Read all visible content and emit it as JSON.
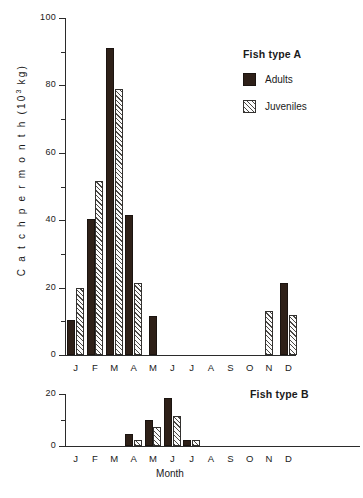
{
  "chart_data": [
    {
      "type": "bar",
      "panel": "A",
      "title": "Fish type  A",
      "xlabel": "",
      "ylabel": "Catch per month (10³ kg)",
      "ylabel_prefix": "C a t c h   p e r   m o n t h   (10",
      "ylabel_exp": "3",
      "ylabel_suffix": " kg)",
      "categories": [
        "J",
        "F",
        "M",
        "A",
        "M",
        "J",
        "J",
        "A",
        "S",
        "O",
        "N",
        "D"
      ],
      "ylim": [
        0,
        100
      ],
      "yticks_major": [
        0,
        20,
        40,
        60,
        80,
        100
      ],
      "yticks_minor": [
        10,
        30,
        50,
        70,
        90
      ],
      "ytick_labels": [
        "0",
        "20",
        "40",
        "60",
        "80",
        "100"
      ],
      "grid": false,
      "legend_position": "upper right",
      "series": [
        {
          "name": "Adults",
          "fill": "solid",
          "color": "#2e2018",
          "values": [
            10.5,
            40.5,
            91,
            41.5,
            11.5,
            0,
            0,
            0,
            0,
            0,
            0,
            21.5
          ]
        },
        {
          "name": "Juveniles",
          "fill": "hatched",
          "color": "#4a4744",
          "values": [
            20,
            51.5,
            79,
            21.5,
            0,
            0,
            0,
            0,
            0,
            0,
            13,
            12
          ]
        }
      ]
    },
    {
      "type": "bar",
      "panel": "B",
      "title": "Fish type  B",
      "xlabel": "Month",
      "ylabel": "",
      "categories": [
        "J",
        "F",
        "M",
        "A",
        "M",
        "J",
        "J",
        "A",
        "S",
        "O",
        "N",
        "D"
      ],
      "ylim": [
        0,
        20
      ],
      "yticks_major": [
        0,
        20
      ],
      "yticks_minor": [
        10
      ],
      "ytick_labels": [
        "0",
        "20"
      ],
      "grid": false,
      "legend_position": "none",
      "series": [
        {
          "name": "Adults",
          "fill": "solid",
          "color": "#2e2018",
          "values": [
            0,
            0,
            0,
            4.5,
            10,
            18.5,
            2.5,
            0,
            0,
            0,
            0,
            0
          ]
        },
        {
          "name": "Juveniles",
          "fill": "hatched",
          "color": "#4a4744",
          "values": [
            0,
            0,
            0,
            2.5,
            7.5,
            11.5,
            2.5,
            0,
            0,
            0,
            0,
            0
          ]
        }
      ]
    }
  ],
  "legend": {
    "title": "Fish type  A",
    "items": [
      {
        "label": "Adults",
        "swatch": "solid-swatch"
      },
      {
        "label": "Juveniles",
        "swatch": "hatched-swatch"
      }
    ]
  },
  "panelB_title": "Fish type  B",
  "axis_titles": {
    "y": "Catch per month (10³ kg)",
    "x": "Month"
  }
}
